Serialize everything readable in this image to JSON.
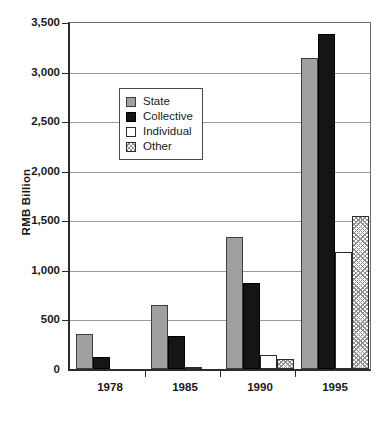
{
  "chart_data": {
    "type": "bar",
    "title": "",
    "subtitle": "",
    "xlabel": "",
    "ylabel": "RMB Billion",
    "categories": [
      "1978",
      "1985",
      "1990",
      "1995"
    ],
    "series": [
      {
        "name": "State",
        "color": "#a0a0a0",
        "values": [
          355,
          650,
          1330,
          3135
        ]
      },
      {
        "name": "Collective",
        "color": "#151515",
        "values": [
          120,
          330,
          870,
          3375
        ]
      },
      {
        "name": "Individual",
        "color": "#ffffff",
        "values": [
          0,
          15,
          140,
          1185
        ]
      },
      {
        "name": "Other",
        "color": "#8f8f8f",
        "values": [
          0,
          5,
          105,
          1545
        ]
      }
    ],
    "ylim": [
      0,
      3500
    ],
    "ytick_values": [
      0,
      500,
      1000,
      1500,
      2000,
      2500,
      3000,
      3500
    ],
    "ytick_labels": [
      "0",
      "500",
      "1,000",
      "1,500",
      "2,000",
      "2,500",
      "3,000",
      "3,500"
    ],
    "grid": true,
    "grid_axis": "y",
    "legend_position": "upper-left-inside",
    "legend_entries": [
      "State",
      "Collective",
      "Individual",
      "Other"
    ]
  },
  "axes": {
    "y_title": "RMB Billion"
  }
}
